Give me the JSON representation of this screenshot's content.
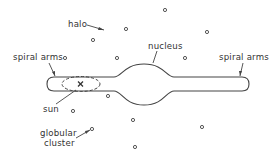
{
  "diagram": {
    "labels": {
      "halo": "halo",
      "spiral_arms_left": "spiral arms",
      "spiral_arms_right": "spiral arms",
      "nucleus": "nucleus",
      "sun": "sun",
      "globular_cluster_line1": "globular",
      "globular_cluster_line2": "cluster"
    },
    "colors": {
      "stroke": "#444444",
      "text": "#333333",
      "background": "#ffffff"
    },
    "components": [
      {
        "name": "disk",
        "description": "flattened galactic disk containing spiral arms"
      },
      {
        "name": "nucleus",
        "description": "central bulge"
      },
      {
        "name": "sun",
        "description": "marked with an x inside a dashed ellipse (solar neighbourhood)"
      },
      {
        "name": "halo",
        "description": "spherical halo of globular clusters (small circles)"
      }
    ],
    "globular_clusters": [
      {
        "x": 126,
        "y": 29
      },
      {
        "x": 93,
        "y": 40
      },
      {
        "x": 165,
        "y": 10
      },
      {
        "x": 207,
        "y": 32
      },
      {
        "x": 185,
        "y": 58
      },
      {
        "x": 117,
        "y": 58
      },
      {
        "x": 65,
        "y": 58
      },
      {
        "x": 108,
        "y": 96
      },
      {
        "x": 73,
        "y": 111
      },
      {
        "x": 133,
        "y": 120
      },
      {
        "x": 202,
        "y": 127
      },
      {
        "x": 92,
        "y": 129
      },
      {
        "x": 135,
        "y": 147
      }
    ]
  }
}
